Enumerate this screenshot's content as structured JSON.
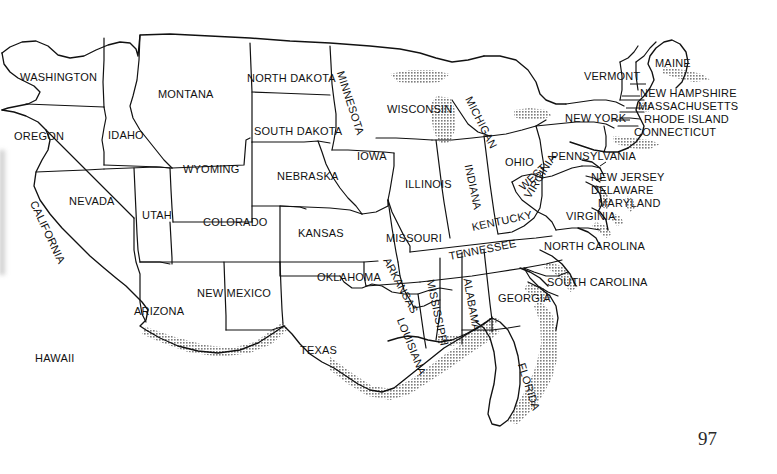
{
  "document": {
    "kind": "map-figure",
    "title": "Map of the United States with state names",
    "page_number": "97",
    "background_color": "#ffffff",
    "ink_color": "#111111",
    "coastal_shading_color": "#8c8c8c"
  },
  "map": {
    "projection_note": "outline map of the contiguous United States, state borders drawn, coastlines stippled/shaded",
    "label_font_size_px": 11,
    "labels": [
      {
        "name": "WASHINGTON",
        "x": 20,
        "y": 72,
        "rotate": 0,
        "size": 11
      },
      {
        "name": "OREGON",
        "x": 14,
        "y": 131,
        "rotate": 0,
        "size": 11
      },
      {
        "name": "IDAHO",
        "x": 108,
        "y": 130,
        "rotate": 0,
        "size": 11
      },
      {
        "name": "MONTANA",
        "x": 158,
        "y": 89,
        "rotate": 0,
        "size": 11
      },
      {
        "name": "WYOMING",
        "x": 183,
        "y": 164,
        "rotate": 0,
        "size": 11
      },
      {
        "name": "NEVADA",
        "x": 69,
        "y": 196,
        "rotate": 0,
        "size": 11
      },
      {
        "name": "CALIFORNIA",
        "x": 33,
        "y": 196,
        "rotate": 65,
        "size": 11
      },
      {
        "name": "UTAH",
        "x": 142,
        "y": 210,
        "rotate": 0,
        "size": 11
      },
      {
        "name": "ARIZONA",
        "x": 134,
        "y": 306,
        "rotate": 0,
        "size": 11
      },
      {
        "name": "NEW MEXICO",
        "x": 197,
        "y": 288,
        "rotate": 0,
        "size": 11
      },
      {
        "name": "COLORADO",
        "x": 203,
        "y": 217,
        "rotate": 0,
        "size": 11
      },
      {
        "name": "NORTH DAKOTA",
        "x": 247,
        "y": 73,
        "rotate": 0,
        "size": 11
      },
      {
        "name": "SOUTH DAKOTA",
        "x": 254,
        "y": 126,
        "rotate": 0,
        "size": 11
      },
      {
        "name": "NEBRASKA",
        "x": 277,
        "y": 171,
        "rotate": 0,
        "size": 11
      },
      {
        "name": "KANSAS",
        "x": 298,
        "y": 228,
        "rotate": 0,
        "size": 11
      },
      {
        "name": "OKLAHOMA",
        "x": 317,
        "y": 272,
        "rotate": 0,
        "size": 11
      },
      {
        "name": "TEXAS",
        "x": 300,
        "y": 345,
        "rotate": 0,
        "size": 11
      },
      {
        "name": "MINNESOTA",
        "x": 340,
        "y": 66,
        "rotate": 72,
        "size": 11
      },
      {
        "name": "IOWA",
        "x": 357,
        "y": 151,
        "rotate": 0,
        "size": 11
      },
      {
        "name": "MISSOURI",
        "x": 386,
        "y": 233,
        "rotate": 0,
        "size": 11
      },
      {
        "name": "ARKANSAS",
        "x": 386,
        "y": 253,
        "rotate": 62,
        "size": 11
      },
      {
        "name": "LOUISIANA",
        "x": 400,
        "y": 313,
        "rotate": 68,
        "size": 11
      },
      {
        "name": "WISCONSIN",
        "x": 387,
        "y": 104,
        "rotate": 0,
        "size": 11
      },
      {
        "name": "ILLINOIS",
        "x": 405,
        "y": 179,
        "rotate": 0,
        "size": 11
      },
      {
        "name": "MISSISSIPPI",
        "x": 430,
        "y": 274,
        "rotate": 78,
        "size": 11
      },
      {
        "name": "MICHIGAN",
        "x": 468,
        "y": 92,
        "rotate": 63,
        "size": 11
      },
      {
        "name": "INDIANA",
        "x": 468,
        "y": 159,
        "rotate": 78,
        "size": 11
      },
      {
        "name": "ALABAMA",
        "x": 467,
        "y": 273,
        "rotate": 80,
        "size": 11
      },
      {
        "name": "OHIO",
        "x": 505,
        "y": 157,
        "rotate": 0,
        "size": 11
      },
      {
        "name": "KENTUCKY",
        "x": 472,
        "y": 222,
        "rotate": -12,
        "size": 11
      },
      {
        "name": "TENNESSEE",
        "x": 449,
        "y": 251,
        "rotate": -11,
        "size": 11
      },
      {
        "name": "GEORGIA",
        "x": 498,
        "y": 293,
        "rotate": 0,
        "size": 11
      },
      {
        "name": "FLORIDA",
        "x": 521,
        "y": 358,
        "rotate": 72,
        "size": 11
      },
      {
        "name": "WEST",
        "x": 521,
        "y": 183,
        "rotate": -43,
        "size": 11
      },
      {
        "name": "VIRGINIA",
        "x": 527,
        "y": 192,
        "rotate": -58,
        "size": 11
      },
      {
        "name": "VIRGINIA ",
        "x": 566,
        "y": 211,
        "rotate": 0,
        "size": 11
      },
      {
        "name": "PENNSYLVANIA",
        "x": 551,
        "y": 151,
        "rotate": 0,
        "size": 11
      },
      {
        "name": "NEW JERSEY",
        "x": 591,
        "y": 172,
        "rotate": 0,
        "size": 11
      },
      {
        "name": "DELAWARE",
        "x": 591,
        "y": 185,
        "rotate": 0,
        "size": 11
      },
      {
        "name": "MARYLAND",
        "x": 598,
        "y": 198,
        "rotate": 0,
        "size": 11
      },
      {
        "name": "NEW YORK",
        "x": 565,
        "y": 113,
        "rotate": 0,
        "size": 11
      },
      {
        "name": "VERMONT",
        "x": 584,
        "y": 71,
        "rotate": 0,
        "size": 11
      },
      {
        "name": "MAINE",
        "x": 655,
        "y": 58,
        "rotate": 0,
        "size": 11
      },
      {
        "name": "NEW HAMPSHIRE",
        "x": 640,
        "y": 88,
        "rotate": 0,
        "size": 11
      },
      {
        "name": "MASSACHUSETTS",
        "x": 638,
        "y": 101,
        "rotate": 0,
        "size": 11
      },
      {
        "name": "RHODE ISLAND",
        "x": 644,
        "y": 114,
        "rotate": 0,
        "size": 11
      },
      {
        "name": "CONNECTICUT",
        "x": 634,
        "y": 127,
        "rotate": 0,
        "size": 11
      },
      {
        "name": "NORTH CAROLINA",
        "x": 544,
        "y": 241,
        "rotate": 0,
        "size": 11
      },
      {
        "name": "SOUTH CAROLINA",
        "x": 547,
        "y": 277,
        "rotate": 0,
        "size": 11
      },
      {
        "name": "HAWAII",
        "x": 35,
        "y": 353,
        "rotate": 0,
        "size": 11
      }
    ]
  }
}
